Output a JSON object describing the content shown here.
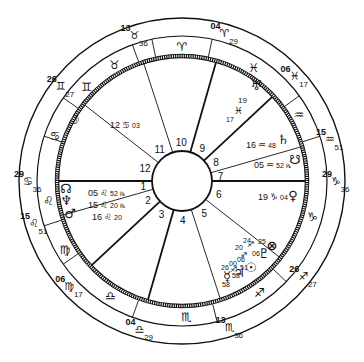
{
  "chart": {
    "center": [
      182,
      181
    ],
    "radii": {
      "outer": 163,
      "middle": 145,
      "inner": 125,
      "hub": 30
    },
    "colors": {
      "ink": "#111111",
      "background": "#ffffff"
    }
  },
  "cusps": [
    {
      "house": 1,
      "deg": "29",
      "sign": "cancer",
      "min": "36",
      "angle": 180
    },
    {
      "house": 2,
      "deg": "15",
      "sign": "leo",
      "min": "51",
      "angle": 196
    },
    {
      "house": 3,
      "deg": "06",
      "sign": "virgo",
      "min": "17",
      "angle": 223
    },
    {
      "house": 4,
      "deg": "04",
      "sign": "libra",
      "min": "29",
      "angle": 254
    },
    {
      "house": 5,
      "deg": "13",
      "sign": "scorpio",
      "min": "36",
      "angle": 288
    },
    {
      "house": 6,
      "deg": "26",
      "sign": "sagittarius",
      "min": "27",
      "angle": 322
    },
    {
      "house": 7,
      "deg": "29",
      "sign": "capricorn",
      "min": "36",
      "angle": 0
    },
    {
      "house": 8,
      "deg": "15",
      "sign": "aquarius",
      "min": "51",
      "angle": 16
    },
    {
      "house": 9,
      "deg": "06",
      "sign": "pisces",
      "min": "17",
      "angle": 43
    },
    {
      "house": 10,
      "deg": "04",
      "sign": "aries",
      "min": "29",
      "angle": 74
    },
    {
      "house": 11,
      "deg": "13",
      "sign": "taurus",
      "min": "36",
      "angle": 108
    },
    {
      "house": 12,
      "deg": "26",
      "sign": "gemini",
      "min": "27",
      "angle": 142
    }
  ],
  "house_numbers": [
    "1",
    "2",
    "3",
    "4",
    "5",
    "6",
    "7",
    "8",
    "9",
    "10",
    "11",
    "12"
  ],
  "sign_ring": [
    {
      "sign": "taurus",
      "glyph": "♉",
      "angle": 120
    },
    {
      "sign": "aries",
      "glyph": "♈",
      "angle": 90
    },
    {
      "sign": "pisces",
      "glyph": "♓",
      "angle": 58
    },
    {
      "sign": "aquarius",
      "glyph": "♒",
      "angle": 30
    },
    {
      "sign": "capricorn",
      "glyph": "♑",
      "angle": 345
    },
    {
      "sign": "sagittarius",
      "glyph": "♐",
      "angle": 305
    },
    {
      "sign": "scorpio",
      "glyph": "♏",
      "angle": 272
    },
    {
      "sign": "libra",
      "glyph": "♎",
      "angle": 238
    },
    {
      "sign": "virgo",
      "glyph": "♍",
      "angle": 210
    },
    {
      "sign": "leo",
      "glyph": "♌",
      "angle": 188
    },
    {
      "sign": "cancer",
      "glyph": "♋",
      "angle": 160
    },
    {
      "sign": "gemini",
      "glyph": "♊",
      "angle": 135
    }
  ],
  "planets": [
    {
      "name": "moon",
      "glyph": "☽",
      "deg": "12",
      "sign_glyph": "♋",
      "min": "03",
      "x": 74,
      "y": 124
    },
    {
      "name": "north-node",
      "glyph": "☊",
      "deg": "05",
      "sign_glyph": "♌",
      "min": "52",
      "retro": "℞",
      "x": 66,
      "y": 193
    },
    {
      "name": "neptune",
      "glyph": "♆",
      "deg": "15",
      "sign_glyph": "♌",
      "min": "20",
      "retro": "℞",
      "x": 66,
      "y": 205
    },
    {
      "name": "mars",
      "glyph": "♂",
      "deg": "16",
      "sign_glyph": "♌",
      "min": "20",
      "x": 70,
      "y": 218
    },
    {
      "name": "uranus",
      "glyph": "♅",
      "deg": "19",
      "sign_glyph": "♓",
      "min": "17",
      "x": 256,
      "y": 90
    },
    {
      "name": "saturn",
      "glyph": "♄",
      "deg": "16",
      "sign_glyph": "♒",
      "min": "48",
      "x": 283,
      "y": 144
    },
    {
      "name": "south-node",
      "glyph": "☋",
      "deg": "05",
      "sign_glyph": "♒",
      "min": "52",
      "retro": "℞",
      "x": 295,
      "y": 164
    },
    {
      "name": "venus",
      "glyph": "♀",
      "deg": "19",
      "sign_glyph": "♑",
      "min": "04",
      "x": 293,
      "y": 200
    },
    {
      "name": "part-of-fortune",
      "glyph": "⊗",
      "deg": "25",
      "sign_glyph": "♐",
      "min": "06",
      "x": 272,
      "y": 250
    },
    {
      "name": "pluto",
      "glyph": "♇",
      "deg": "24",
      "sign_glyph": "♐",
      "min": "06",
      "x": 264,
      "y": 258
    },
    {
      "name": "sun",
      "glyph": "☉",
      "deg": "20",
      "sign_glyph": "♐",
      "min": "51",
      "x": 251,
      "y": 272
    },
    {
      "name": "jupiter",
      "glyph": "♃",
      "deg": "06",
      "sign_glyph": "♐",
      "min": "58",
      "x": 239,
      "y": 277
    },
    {
      "name": "mercury",
      "glyph": "☿",
      "deg": "26",
      "sign_glyph": "♏",
      "min": "58",
      "x": 227,
      "y": 281
    }
  ],
  "sag_stellium_labels": [
    {
      "text": "24",
      "x": 243,
      "y": 243
    },
    {
      "text": "20",
      "x": 235,
      "y": 250
    },
    {
      "text": "25",
      "x": 258,
      "y": 244
    },
    {
      "text": "06",
      "x": 252,
      "y": 256
    },
    {
      "text": "06",
      "x": 237,
      "y": 262
    },
    {
      "text": "00",
      "x": 229,
      "y": 266
    },
    {
      "text": "26",
      "x": 221,
      "y": 270
    },
    {
      "text": "51",
      "x": 240,
      "y": 270
    },
    {
      "text": "58",
      "x": 232,
      "y": 278
    },
    {
      "text": "58",
      "x": 222,
      "y": 287
    }
  ]
}
